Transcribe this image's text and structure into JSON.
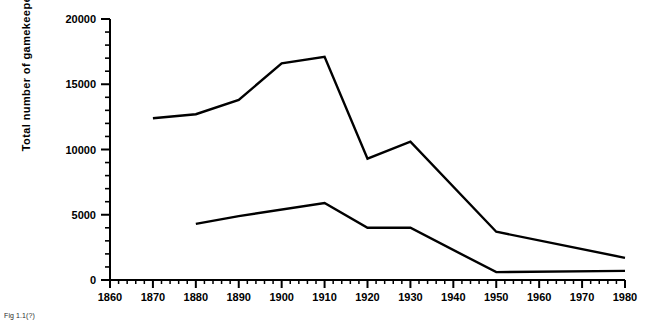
{
  "chart_data": {
    "type": "line",
    "title": "",
    "xlabel": "",
    "ylabel": "Total number of gamekeepers",
    "xlim": [
      1860,
      1980
    ],
    "ylim": [
      0,
      20000
    ],
    "grid": false,
    "legend_position": "none",
    "x_ticks": [
      1860,
      1870,
      1880,
      1890,
      1900,
      1910,
      1920,
      1930,
      1940,
      1950,
      1960,
      1970,
      1980
    ],
    "y_ticks": [
      0,
      5000,
      10000,
      15000,
      20000
    ],
    "x_minor_tick_interval": 2,
    "y_minor_tick_interval": 1000,
    "series": [
      {
        "name": "upper-series",
        "x": [
          1870,
          1880,
          1890,
          1900,
          1910,
          1920,
          1930,
          1950,
          1980
        ],
        "values": [
          12400,
          12700,
          13800,
          16600,
          17100,
          9300,
          10600,
          3700,
          1700
        ]
      },
      {
        "name": "lower-series",
        "x": [
          1880,
          1890,
          1910,
          1920,
          1930,
          1950,
          1980
        ],
        "values": [
          4300,
          4900,
          5900,
          4000,
          4000,
          600,
          700
        ]
      }
    ]
  },
  "axis": {
    "y_title": "Total number of gamekeepers",
    "y_tick_labels": [
      "20000",
      "15000",
      "10000",
      "5000",
      "0"
    ],
    "x_tick_labels": [
      "1860",
      "1870",
      "1880",
      "1890",
      "1900",
      "1910",
      "1920",
      "1930",
      "1940",
      "1950",
      "1960",
      "1970",
      "1980"
    ]
  },
  "caption": {
    "text": "Fig 1.1(?)"
  },
  "colors": {
    "line": "#000000",
    "axis": "#000000",
    "background": "#ffffff"
  }
}
